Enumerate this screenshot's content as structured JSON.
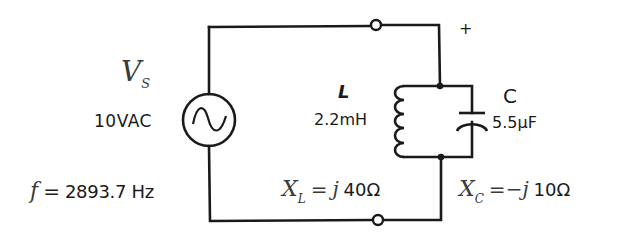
{
  "diagram": {
    "type": "parallel LC tank circuit",
    "source": {
      "symbol": "V",
      "symbol_sub": "S",
      "value": "10VAC",
      "frequency_lhs": "f",
      "frequency_eq": "=",
      "frequency_value": "2893.7 Hz"
    },
    "inductor": {
      "name": "L",
      "value": "2.2mH",
      "reactance_symbol": "X",
      "reactance_sub": "L",
      "reactance_eq": "=",
      "reactance_j": "j",
      "reactance_value": "40Ω"
    },
    "capacitor": {
      "name": "C",
      "value": "5.5μF",
      "reactance_symbol": "X",
      "reactance_sub": "C",
      "reactance_eq": "=",
      "reactance_sign": "−",
      "reactance_j": "j",
      "reactance_value": "10Ω"
    },
    "output_polarity": "+",
    "colors": {
      "wire": "#1a1a1a",
      "background": "#ffffff"
    }
  }
}
